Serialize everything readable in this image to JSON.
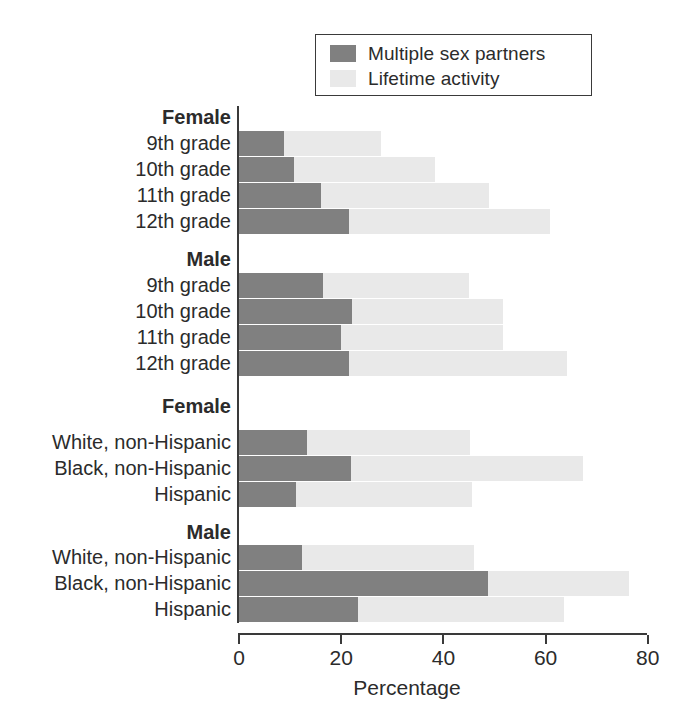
{
  "legend": {
    "items": [
      {
        "label": "Multiple sex partners",
        "color": "#808080",
        "icon": "legend-swatch-dark"
      },
      {
        "label": "Lifetime activity",
        "color": "#e9e9e9",
        "icon": "legend-swatch-light"
      }
    ]
  },
  "axis": {
    "x_label": "Percentage",
    "ticks": [
      "0",
      "20",
      "40",
      "60",
      "80"
    ]
  },
  "chart_data": {
    "type": "bar",
    "orientation": "horizontal",
    "stacked": true,
    "title": "",
    "xlabel": "Percentage",
    "ylabel": "",
    "xlim": [
      0,
      80
    ],
    "xticks": [
      0,
      20,
      40,
      60,
      80
    ],
    "grid": false,
    "legend_position": "top-right",
    "series": [
      {
        "name": "Multiple sex partners",
        "color": "#808080",
        "values": [
          8.8,
          10.7,
          16.0,
          21.5,
          16.4,
          22.2,
          20.0,
          21.5,
          13.3,
          22.0,
          11.2,
          12.4,
          48.8,
          23.3
        ]
      },
      {
        "name": "Lifetime activity",
        "color": "#e9e9e9",
        "values": [
          27.8,
          38.4,
          49.0,
          60.8,
          45.0,
          51.6,
          51.6,
          64.2,
          45.2,
          67.3,
          45.6,
          45.6,
          76.3,
          63.6
        ]
      }
    ],
    "categories": [
      "9th grade",
      "10th grade",
      "11th grade",
      "12th grade",
      "9th grade",
      "10th grade",
      "11th grade",
      "12th grade",
      "White, non-Hispanic",
      "Black, non-Hispanic",
      "Hispanic",
      "White, non-Hispanic",
      "Black, non-Hispanic",
      "Hispanic"
    ],
    "group_headings": [
      "Female",
      "Male",
      "Female",
      "Male"
    ],
    "note": "Lifetime activity values are the total bar extent (cumulative); dark segment is Multiple sex partners."
  },
  "rows": [
    {
      "kind": "heading",
      "label": "Female",
      "top": 104,
      "height": 26
    },
    {
      "kind": "bar",
      "label": "9th grade",
      "top": 131,
      "height": 25,
      "dark": 8.8,
      "total": 27.8
    },
    {
      "kind": "bar",
      "label": "10th grade",
      "top": 157,
      "height": 25,
      "dark": 10.7,
      "total": 38.4
    },
    {
      "kind": "bar",
      "label": "11th grade",
      "top": 183,
      "height": 25,
      "dark": 16.0,
      "total": 49.0
    },
    {
      "kind": "bar",
      "label": "12th grade",
      "top": 209,
      "height": 25,
      "dark": 21.5,
      "total": 60.8
    },
    {
      "kind": "heading",
      "label": "Male",
      "top": 246,
      "height": 26
    },
    {
      "kind": "bar",
      "label": "9th grade",
      "top": 273,
      "height": 25,
      "dark": 16.4,
      "total": 45.0
    },
    {
      "kind": "bar",
      "label": "10th grade",
      "top": 299,
      "height": 25,
      "dark": 22.2,
      "total": 51.6
    },
    {
      "kind": "bar",
      "label": "11th grade",
      "top": 325,
      "height": 25,
      "dark": 20.0,
      "total": 51.6
    },
    {
      "kind": "bar",
      "label": "12th grade",
      "top": 351,
      "height": 25,
      "dark": 21.5,
      "total": 64.2
    },
    {
      "kind": "heading",
      "label": "Female",
      "top": 393,
      "height": 26
    },
    {
      "kind": "bar",
      "label": "White, non-Hispanic",
      "top": 430,
      "height": 25,
      "dark": 13.3,
      "total": 45.2
    },
    {
      "kind": "bar",
      "label": "Black, non-Hispanic",
      "top": 456,
      "height": 25,
      "dark": 22.0,
      "total": 67.3
    },
    {
      "kind": "bar",
      "label": "Hispanic",
      "top": 482,
      "height": 25,
      "dark": 11.2,
      "total": 45.6
    },
    {
      "kind": "heading",
      "label": "Male",
      "top": 519,
      "height": 26
    },
    {
      "kind": "bar",
      "label": "White, non-Hispanic",
      "top": 545,
      "height": 25,
      "dark": 12.4,
      "total": 46.0
    },
    {
      "kind": "bar",
      "label": "Black, non-Hispanic",
      "top": 571,
      "height": 25,
      "dark": 48.8,
      "total": 76.3
    },
    {
      "kind": "bar",
      "label": "Hispanic",
      "top": 597,
      "height": 25,
      "dark": 23.3,
      "total": 63.6
    }
  ]
}
